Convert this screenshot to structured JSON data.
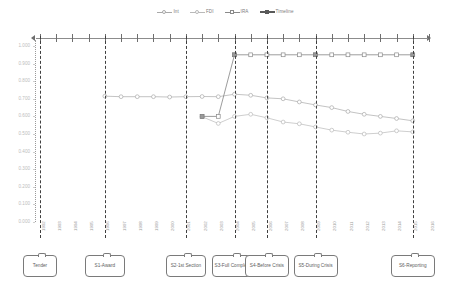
{
  "legend": {
    "items": [
      {
        "label": "Int",
        "marker": "circle",
        "color": "#a9a9a9"
      },
      {
        "label": "FDI",
        "marker": "circle",
        "color": "#b9b9b9"
      },
      {
        "label": "IRA",
        "marker": "square",
        "color": "#8a8a8a"
      },
      {
        "label": "Timeline",
        "marker": "timeline",
        "color": "#595959"
      }
    ]
  },
  "axis": {
    "y_ticks": [
      "1.000",
      "0.900",
      "0.800",
      "0.700",
      "0.600",
      "0.500",
      "0.400",
      "0.300",
      "0.200",
      "0.100",
      "0.000"
    ],
    "x_ticks": [
      "1992",
      "1993",
      "1994",
      "1995",
      "1996",
      "1997",
      "1998",
      "1999",
      "2000",
      "2001",
      "2002",
      "2003",
      "2004",
      "2005",
      "2006",
      "2007",
      "2008",
      "2009",
      "2010",
      "2011",
      "2012",
      "2013",
      "2014",
      "2015",
      "2016"
    ]
  },
  "callouts": [
    {
      "label": "Tender",
      "year": "1992"
    },
    {
      "label": "S1-Award",
      "year": "1996"
    },
    {
      "label": "S2-1st Section",
      "year": "2001"
    },
    {
      "label": "S3-Full Completion",
      "year": "2004"
    },
    {
      "label": "S4-Before Crisis",
      "year": "2006"
    },
    {
      "label": "S5-During Crisis",
      "year": "2009"
    },
    {
      "label": "S6-Reporting",
      "year": "2015"
    }
  ],
  "chart_data": {
    "type": "line",
    "title": "",
    "xlabel": "",
    "ylabel": "",
    "ylim": [
      0.0,
      1.0
    ],
    "grid": false,
    "legend_position": "top-center",
    "x": [
      "1992",
      "1993",
      "1994",
      "1995",
      "1996",
      "1997",
      "1998",
      "1999",
      "2000",
      "2001",
      "2002",
      "2003",
      "2004",
      "2005",
      "2006",
      "2007",
      "2008",
      "2009",
      "2010",
      "2011",
      "2012",
      "2013",
      "2014",
      "2015",
      "2016"
    ],
    "series": [
      {
        "name": "Int",
        "marker": "circle",
        "color": "#a9a9a9",
        "x": [
          "1996",
          "1997",
          "1998",
          "1999",
          "2000",
          "2001",
          "2002",
          "2003",
          "2004",
          "2005",
          "2006",
          "2007",
          "2008",
          "2009",
          "2010",
          "2011",
          "2012",
          "2013",
          "2014",
          "2015"
        ],
        "values": [
          0.715,
          0.712,
          0.712,
          0.712,
          0.71,
          0.712,
          0.713,
          0.712,
          0.726,
          0.72,
          0.705,
          0.7,
          0.682,
          0.665,
          0.65,
          0.628,
          0.612,
          0.6,
          0.588,
          0.575
        ]
      },
      {
        "name": "FDI",
        "marker": "circle",
        "color": "#b9b9b9",
        "x": [
          "2002",
          "2003",
          "2004",
          "2005",
          "2006",
          "2007",
          "2008",
          "2009",
          "2010",
          "2011",
          "2012",
          "2013",
          "2014",
          "2015"
        ],
        "values": [
          0.598,
          0.56,
          0.6,
          0.612,
          0.592,
          0.568,
          0.558,
          0.54,
          0.522,
          0.51,
          0.5,
          0.505,
          0.518,
          0.512
        ]
      },
      {
        "name": "IRA",
        "marker": "square",
        "color": "#8a8a8a",
        "x": [
          "2002",
          "2003",
          "2004",
          "2005",
          "2006",
          "2007",
          "2008",
          "2009",
          "2010",
          "2011",
          "2012",
          "2013",
          "2014",
          "2015"
        ],
        "values": [
          0.6,
          0.6,
          0.95,
          0.95,
          0.95,
          0.95,
          0.95,
          0.95,
          0.95,
          0.95,
          0.95,
          0.95,
          0.95,
          0.95
        ]
      }
    ],
    "stage_markers": [
      "1992",
      "1996",
      "2001",
      "2004",
      "2006",
      "2009",
      "2015"
    ]
  }
}
